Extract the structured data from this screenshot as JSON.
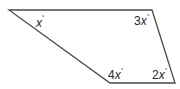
{
  "diagram": {
    "type": "quadrilateral",
    "stroke_color": "#4a4a4a",
    "vertices": [
      {
        "name": "top-left",
        "x": 9,
        "y": 10
      },
      {
        "name": "top-right",
        "x": 152,
        "y": 10
      },
      {
        "name": "bottom-right",
        "x": 175,
        "y": 83
      },
      {
        "name": "bottom-left",
        "x": 110,
        "y": 83
      }
    ],
    "angles": [
      {
        "vertex": "top-left",
        "coef": "",
        "var": "x",
        "unit": "°"
      },
      {
        "vertex": "top-right",
        "coef": "3",
        "var": "x",
        "unit": "°"
      },
      {
        "vertex": "bottom-right",
        "coef": "2",
        "var": "x",
        "unit": "°"
      },
      {
        "vertex": "bottom-left",
        "coef": "4",
        "var": "x",
        "unit": "°"
      }
    ]
  }
}
